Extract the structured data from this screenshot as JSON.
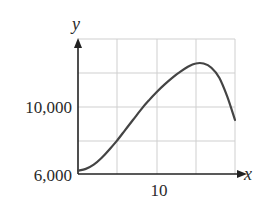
{
  "chart_data": {
    "type": "line",
    "title": "",
    "xlabel": "x",
    "ylabel": "y",
    "xlim": [
      0,
      20
    ],
    "ylim": [
      6000,
      14000
    ],
    "grid": true,
    "x_gridlines": [
      0,
      5,
      10,
      15,
      20
    ],
    "y_gridlines": [
      6000,
      8000,
      10000,
      12000,
      14000
    ],
    "x_tick_labels": [
      {
        "value": 10,
        "label": "10"
      }
    ],
    "y_tick_labels": [
      {
        "value": 6000,
        "label": "6,000"
      },
      {
        "value": 10000,
        "label": "10,000"
      }
    ],
    "series": [
      {
        "name": "y",
        "x": [
          0,
          1,
          2,
          3,
          4,
          5,
          6,
          7,
          8,
          9,
          10,
          11,
          12,
          13,
          14,
          15,
          16,
          17,
          18,
          19,
          20
        ],
        "values": [
          6200,
          6300,
          6550,
          6950,
          7450,
          8000,
          8600,
          9200,
          9800,
          10350,
          10850,
          11300,
          11700,
          12050,
          12350,
          12550,
          12550,
          12300,
          11700,
          10600,
          9200
        ]
      }
    ],
    "colors": {
      "curve": "#444444",
      "grid": "#cccccc",
      "axis": "#222222"
    }
  },
  "labels": {
    "y_axis": "y",
    "x_axis": "x",
    "y_tick_top": "10,000",
    "y_tick_origin": "6,000",
    "x_tick": "10"
  }
}
